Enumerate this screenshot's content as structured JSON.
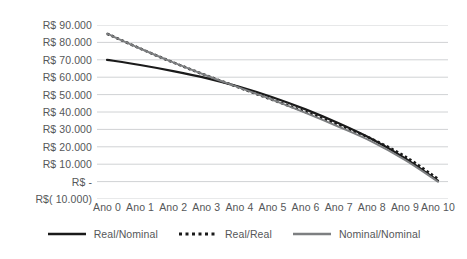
{
  "chart_data": {
    "type": "line",
    "title": "",
    "subtitle": "",
    "xlabel": "",
    "ylabel": "",
    "grid": true,
    "legend_position": "bottom",
    "x": [
      "Ano 0",
      "Ano 1",
      "Ano 2",
      "Ano 3",
      "Ano 4",
      "Ano 5",
      "Ano 6",
      "Ano 7",
      "Ano 8",
      "Ano 9",
      "Ano 10"
    ],
    "ylim": [
      -10000,
      90000
    ],
    "ytick_values": [
      90000,
      80000,
      70000,
      60000,
      50000,
      40000,
      30000,
      20000,
      10000,
      0,
      -10000
    ],
    "ytick_labels": [
      "R$ 90.000",
      "R$ 80.000",
      "R$ 70.000",
      "R$ 60.000",
      "R$ 50.000",
      "R$ 40.000",
      "R$ 30.000",
      "R$ 20.000",
      "R$ 10.000",
      "R$ -",
      "R$( 10.000)"
    ],
    "series": [
      {
        "name": "Real/Nominal",
        "style": "solid",
        "color": "#1a1a1a",
        "width": 2.2,
        "values": [
          70000,
          67000,
          63500,
          59500,
          54500,
          48500,
          41500,
          33500,
          24500,
          13500,
          500
        ]
      },
      {
        "name": "Real/Real",
        "style": "dotted",
        "color": "#1a1a1a",
        "width": 2.6,
        "values": [
          85000,
          76500,
          68500,
          61000,
          54000,
          47000,
          40000,
          32500,
          24500,
          14500,
          1500
        ]
      },
      {
        "name": "Nominal/Nominal",
        "style": "solid",
        "color": "#7d7f81",
        "width": 2.0,
        "values": [
          85000,
          76500,
          68500,
          61000,
          54000,
          47000,
          39500,
          31500,
          23000,
          12500,
          0
        ]
      }
    ]
  },
  "legend": {
    "items": [
      {
        "label": "Real/Nominal"
      },
      {
        "label": "Real/Real"
      },
      {
        "label": "Nominal/Nominal"
      }
    ]
  },
  "axes": {
    "gridline_color": "#d0d2d4",
    "tick_text_color": "#555759"
  }
}
